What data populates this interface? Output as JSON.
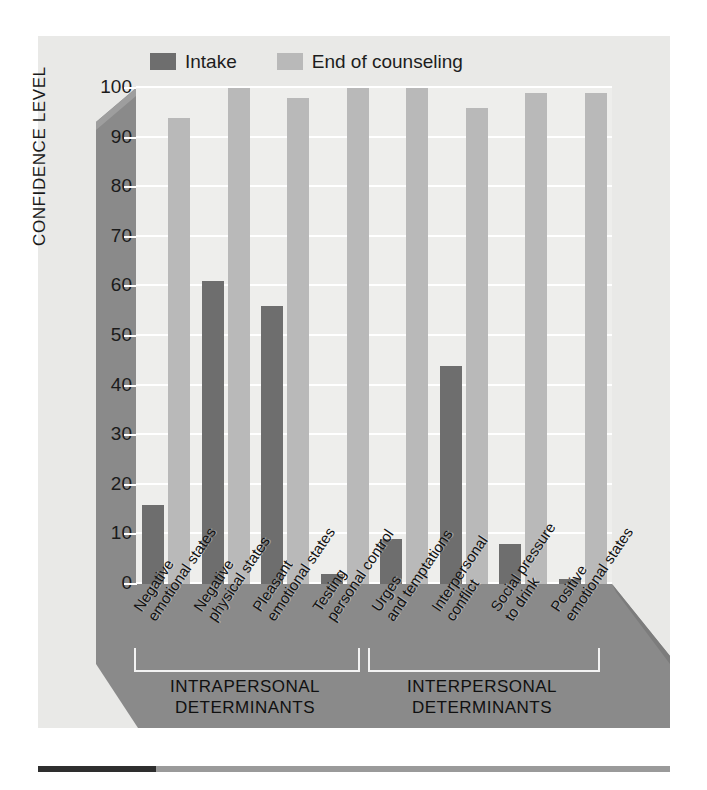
{
  "legend": {
    "items": [
      {
        "label": "Intake",
        "color": "#6e6e6e",
        "key": "intake"
      },
      {
        "label": "End of counseling",
        "color": "#b9b9b9",
        "key": "end"
      }
    ]
  },
  "axes": {
    "ylabel": "CONFIDENCE LEVEL",
    "yticks": [
      "0",
      "10",
      "20",
      "30",
      "40",
      "50",
      "60",
      "70",
      "80",
      "90",
      "100"
    ]
  },
  "groups": [
    {
      "title_line1": "INTRAPERSONAL",
      "title_line2": "DETERMINANTS",
      "count": 5
    },
    {
      "title_line1": "INTERPERSONAL",
      "title_line2": "DETERMINANTS",
      "count": 3
    }
  ],
  "colors": {
    "intake": "#6e6e6e",
    "end_of_counseling": "#b9b9b9",
    "plot_background": "#eeeeec",
    "panel_gray": "#8a8a8a",
    "card_background": "#e9e9e7",
    "gridline": "#ffffff"
  },
  "chart_data": {
    "type": "bar",
    "title": "",
    "xlabel": "",
    "ylabel": "CONFIDENCE LEVEL",
    "ylim": [
      0,
      100
    ],
    "ytick_step": 10,
    "grid": true,
    "legend_position": "top",
    "categories": [
      "Negative emotional states",
      "Negative physical states",
      "Pleasant emotional states",
      "Testing personal control",
      "Urges and temptations",
      "Interpersonal conflict",
      "Social pressure to drink",
      "Positive emotional states"
    ],
    "category_lines": [
      [
        "Negative",
        "emotional states"
      ],
      [
        "Negative",
        "physical states"
      ],
      [
        "Pleasant",
        "emotional states"
      ],
      [
        "Testing",
        "personal control"
      ],
      [
        "Urges",
        "and temptations"
      ],
      [
        "Interpersonal",
        "conflict"
      ],
      [
        "Social pressure",
        "to drink"
      ],
      [
        "Positive",
        "emotional states"
      ]
    ],
    "series": [
      {
        "name": "Intake",
        "color": "#6e6e6e",
        "values": [
          16,
          61,
          56,
          2,
          9,
          44,
          8,
          1
        ]
      },
      {
        "name": "End of counseling",
        "color": "#b9b9b9",
        "values": [
          94,
          100,
          98,
          100,
          100,
          96,
          99,
          99
        ]
      }
    ]
  }
}
